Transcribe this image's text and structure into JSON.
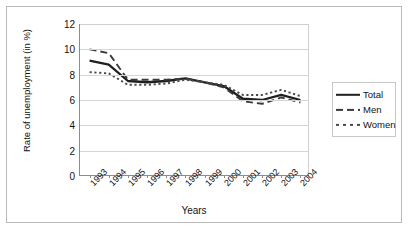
{
  "chart_data": {
    "type": "line",
    "title": "",
    "xlabel": "Years",
    "ylabel": "Rate of unemployment (in %)",
    "categories": [
      "1993",
      "1994",
      "1995",
      "1996",
      "1997",
      "1998",
      "1999",
      "2000",
      "2001",
      "2002",
      "2003",
      "2004"
    ],
    "yticks": [
      0,
      2,
      4,
      6,
      8,
      10,
      12
    ],
    "ylim": [
      0,
      12
    ],
    "grid": true,
    "legend_position": "right",
    "series": [
      {
        "name": "Total",
        "style": "solid",
        "color": "#1f1f1f",
        "values": [
          9.1,
          8.8,
          7.5,
          7.4,
          7.5,
          7.7,
          7.4,
          7.1,
          6.1,
          6.0,
          6.4,
          6.0
        ]
      },
      {
        "name": "Men",
        "style": "dashed",
        "color": "#3a3a3a",
        "values": [
          10.0,
          9.7,
          7.6,
          7.6,
          7.6,
          7.7,
          7.4,
          7.0,
          5.9,
          5.7,
          6.2,
          5.8
        ]
      },
      {
        "name": "Women",
        "style": "dotted",
        "color": "#4a4a4a",
        "values": [
          8.2,
          8.1,
          7.2,
          7.2,
          7.3,
          7.6,
          7.4,
          7.2,
          6.4,
          6.4,
          6.8,
          6.3
        ]
      }
    ]
  },
  "legend": {
    "items": [
      {
        "label": "Total"
      },
      {
        "label": "Men"
      },
      {
        "label": "Women"
      }
    ]
  }
}
